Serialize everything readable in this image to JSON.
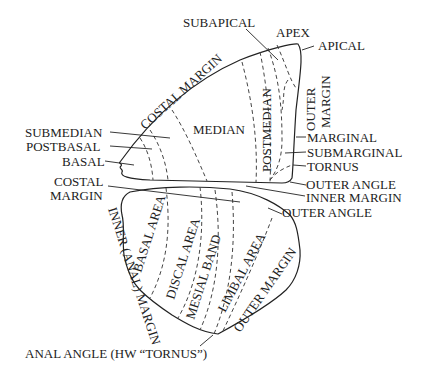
{
  "diagram": {
    "forewing": {
      "labels": {
        "subapical": "SUBAPICAL",
        "apex": "APEX",
        "apical": "APICAL",
        "costal_margin": "COSTAL MARGIN",
        "median": "MEDIAN",
        "postmedian": "POSTMEDIAN",
        "outer_margin_line1": "OUTER",
        "outer_margin_line2": "MARGIN",
        "marginal": "MARGINAL",
        "submarginal": "SUBMARGINAL",
        "tornus": "TORNUS",
        "outer_angle": "OUTER ANGLE",
        "inner_margin": "INNER MARGIN",
        "submedian": "SUBMEDIAN",
        "postbasal": "POSTBASAL",
        "basal": "BASAL"
      }
    },
    "hindwing": {
      "labels": {
        "costal_margin_line1": "COSTAL",
        "costal_margin_line2": "MARGIN",
        "outer_angle": "OUTER ANGLE",
        "inner_anal_margin": "INNER (ANAL) MARGIN",
        "basal_area": "BASAL AREA",
        "discal_area": "DISCAL AREA",
        "mesial_band": "MESIAL BAND",
        "limbal_area": "LIMBAL AREA",
        "outer_margin": "OUTER MARGIN",
        "anal_angle": "ANAL ANGLE (HW “TORNUS”)"
      }
    }
  }
}
